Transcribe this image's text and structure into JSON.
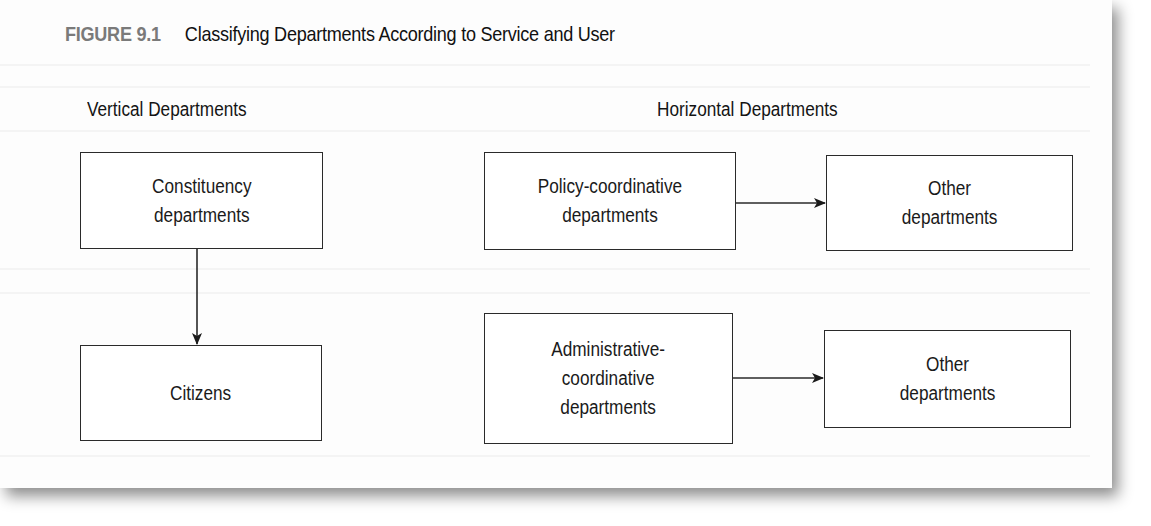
{
  "figure": {
    "label": "FIGURE 9.1",
    "title": "Classifying Departments According to Service and User"
  },
  "columns": {
    "vertical": {
      "heading": "Vertical Departments",
      "boxes": [
        {
          "id": "constituency",
          "text": "Constituency\ndepartments"
        },
        {
          "id": "citizens",
          "text": "Citizens"
        }
      ]
    },
    "horizontal": {
      "heading": "Horizontal Departments",
      "boxes": [
        {
          "id": "policy",
          "text": "Policy-coordinative\ndepartments"
        },
        {
          "id": "other1",
          "text": "Other\ndepartments"
        },
        {
          "id": "admin",
          "text": "Administrative-\ncoordinative\ndepartments"
        },
        {
          "id": "other2",
          "text": "Other\ndepartments"
        }
      ]
    }
  },
  "edges": [
    {
      "from": "Constituency departments",
      "to": "Citizens",
      "direction": "down"
    },
    {
      "from": "Policy-coordinative departments",
      "to": "Other departments",
      "direction": "right"
    },
    {
      "from": "Administrative-coordinative departments",
      "to": "Other departments",
      "direction": "right"
    }
  ],
  "colors": {
    "figure_label": "#7a7a7a",
    "text": "#1a1a1a",
    "stroke": "#2a2a2a",
    "page": "#fdfdfd"
  }
}
